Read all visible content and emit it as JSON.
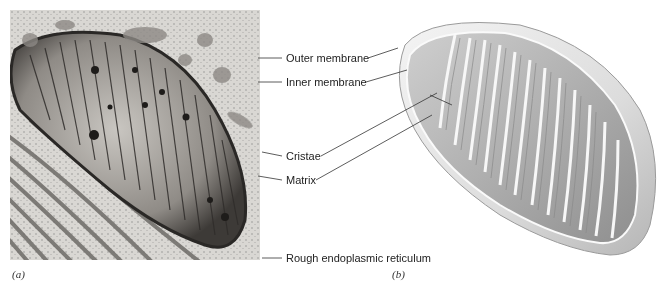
{
  "figure": {
    "panels": [
      {
        "id": "a",
        "label": "(a)",
        "type": "electron-micrograph"
      },
      {
        "id": "b",
        "label": "(b)",
        "type": "cutaway-illustration"
      }
    ],
    "labels": [
      {
        "text": "Outer membrane",
        "y": 58
      },
      {
        "text": "Inner membrane",
        "y": 82
      },
      {
        "text": "Cristae",
        "y": 156
      },
      {
        "text": "Matrix",
        "y": 180
      },
      {
        "text": "Rough endoplasmic reticulum",
        "y": 258
      }
    ],
    "colors": {
      "text": "#222222",
      "line": "#333333",
      "micrograph_bg": "#d8d6d2",
      "illustration": "#bdbdbd"
    }
  }
}
